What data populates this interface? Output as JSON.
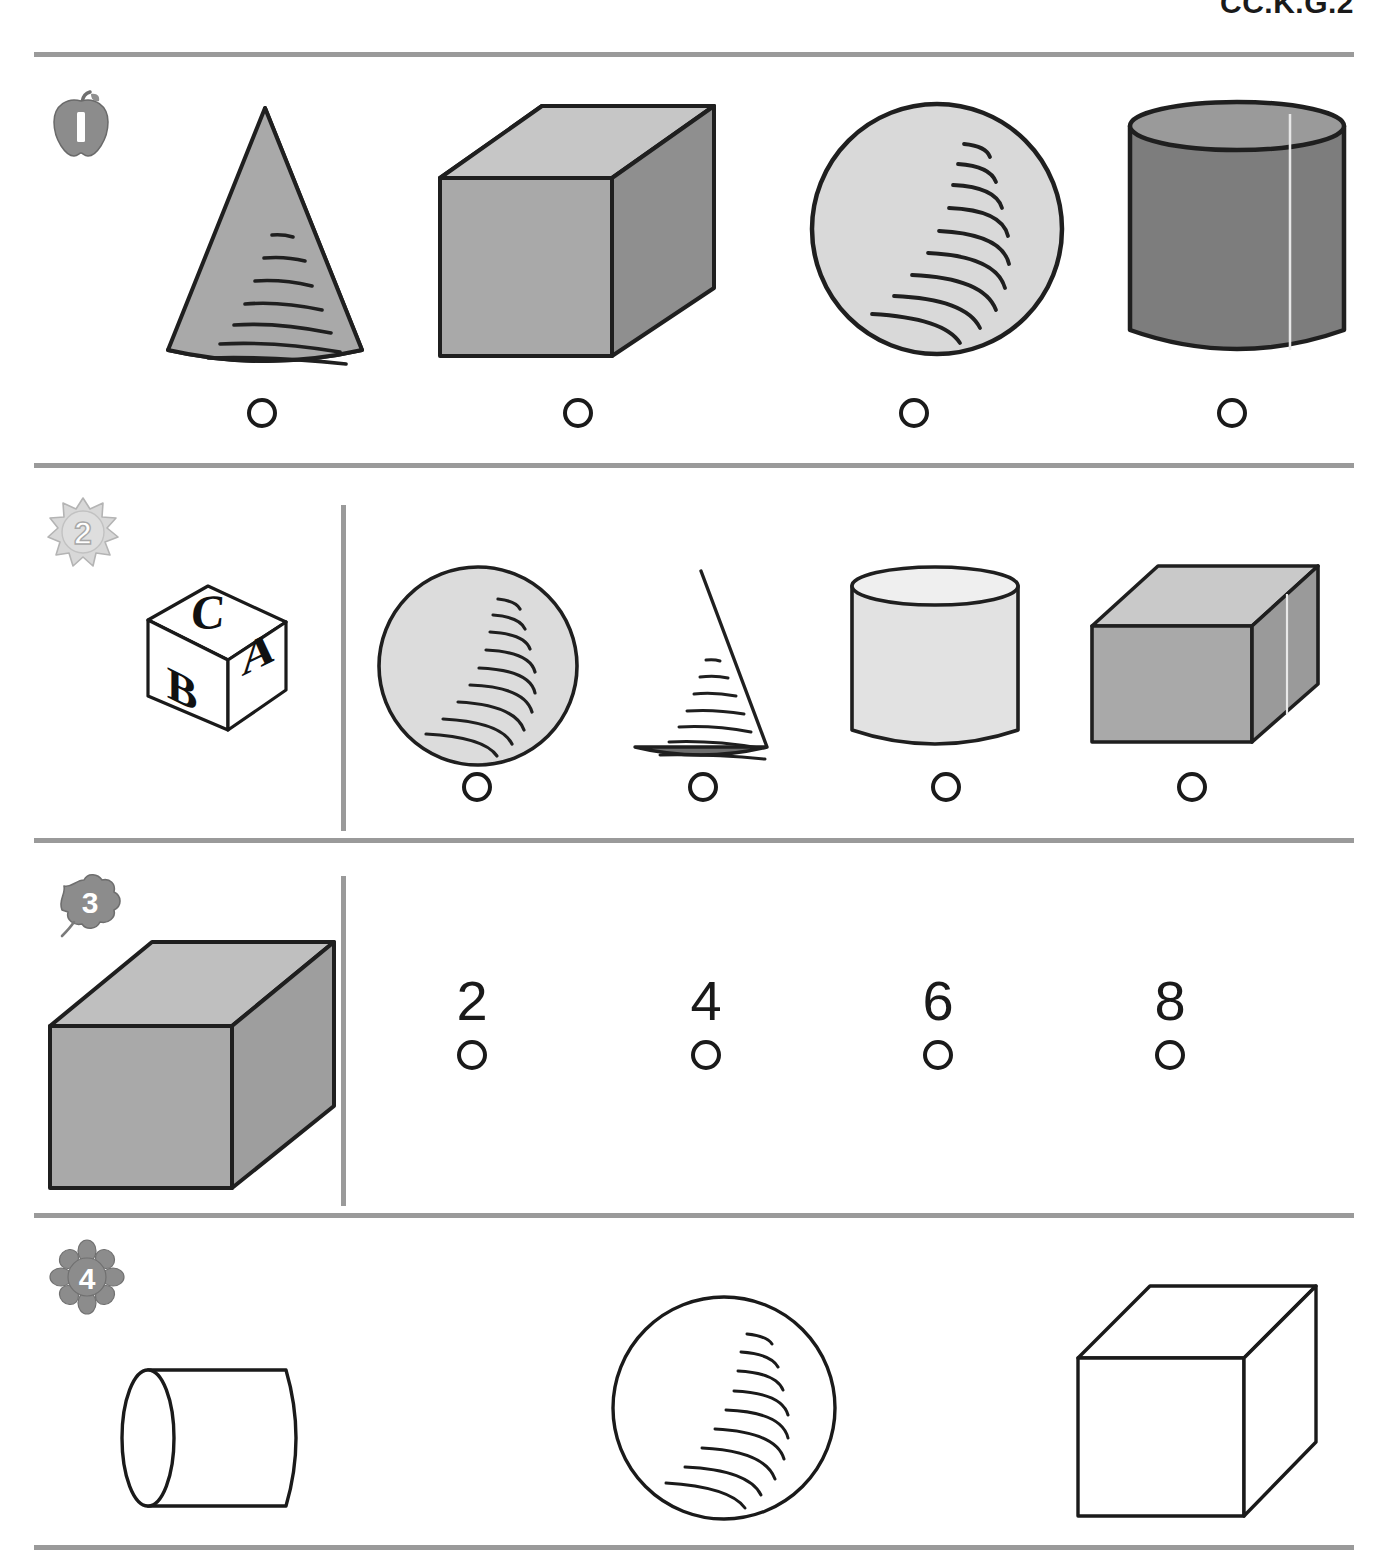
{
  "header": {
    "standard_code": "CC.K.G.2"
  },
  "worksheet": {
    "title": "CC.K.G.2",
    "questions": [
      {
        "number": "1",
        "marker_icon": "apple-icon",
        "marker_label": "1",
        "has_prompt_shape": false,
        "has_divider": false,
        "options": [
          {
            "shape": "cone",
            "shape_label": "cone",
            "fill": "#a9a9a9",
            "bubble": "answer-bubble"
          },
          {
            "shape": "cube",
            "shape_label": "cube",
            "fill": "#a9a9a9",
            "bubble": "answer-bubble"
          },
          {
            "shape": "sphere",
            "shape_label": "sphere",
            "fill": "#d9d9d9",
            "bubble": "answer-bubble"
          },
          {
            "shape": "cylinder",
            "shape_label": "cylinder",
            "fill": "#7d7d7d",
            "bubble": "answer-bubble"
          }
        ]
      },
      {
        "number": "2",
        "marker_icon": "sun-icon",
        "marker_label": "2",
        "has_prompt_shape": true,
        "has_divider": true,
        "prompt": {
          "shape": "alphabet-block",
          "shape_label": "alphabet block",
          "letters": {
            "top": "C",
            "left": "B",
            "right": "A"
          }
        },
        "options": [
          {
            "shape": "sphere",
            "shape_label": "sphere",
            "fill": "#dcdcdc",
            "bubble": "answer-bubble"
          },
          {
            "shape": "cone",
            "shape_label": "cone",
            "fill": "#6e6e6e",
            "bubble": "answer-bubble"
          },
          {
            "shape": "cylinder",
            "shape_label": "cylinder",
            "fill": "#e2e2e2",
            "bubble": "answer-bubble"
          },
          {
            "shape": "cuboid",
            "shape_label": "rectangular prism",
            "fill": "#a9a9a9",
            "bubble": "answer-bubble"
          }
        ]
      },
      {
        "number": "3",
        "marker_icon": "leaf-icon",
        "marker_label": "3",
        "has_prompt_shape": true,
        "has_divider": true,
        "prompt": {
          "shape": "cube",
          "shape_label": "cube",
          "fill": "#a9a9a9"
        },
        "options": [
          {
            "value": "2",
            "bubble": "answer-bubble"
          },
          {
            "value": "4",
            "bubble": "answer-bubble"
          },
          {
            "value": "6",
            "bubble": "answer-bubble"
          },
          {
            "value": "8",
            "bubble": "answer-bubble"
          }
        ]
      },
      {
        "number": "4",
        "marker_icon": "flower-icon",
        "marker_label": "4",
        "has_prompt_shape": false,
        "has_divider": false,
        "options": [
          {
            "shape": "cylinder-horizontal",
            "shape_label": "cylinder",
            "fill": "#ffffff"
          },
          {
            "shape": "sphere",
            "shape_label": "sphere",
            "fill": "#ffffff"
          },
          {
            "shape": "cube",
            "shape_label": "cube",
            "fill": "#ffffff"
          }
        ]
      }
    ]
  },
  "colors": {
    "rule": "#9a9a9a",
    "ink": "#1a1a1a",
    "marker_gray": "#8c8c8c",
    "marker_light": "#cfcfcf"
  }
}
